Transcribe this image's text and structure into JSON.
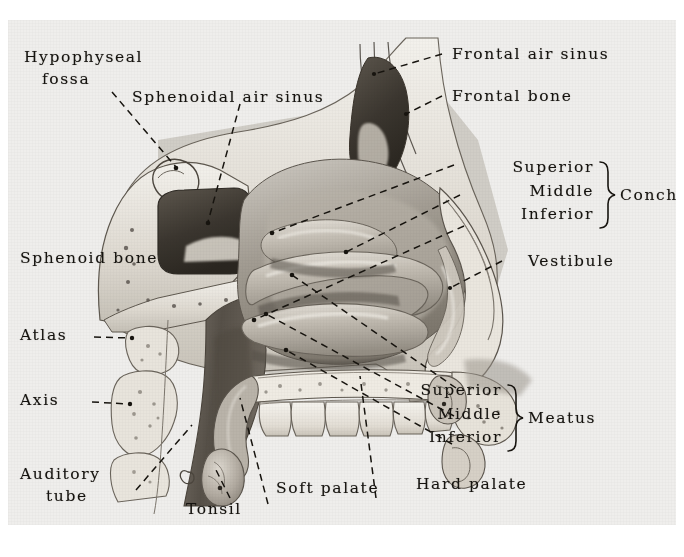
{
  "figure": {
    "medium": "halftone anatomical illustration, grayscale print scan",
    "background_color": "#efeeec",
    "ink_color": "#15130f"
  },
  "labels": {
    "hypophyseal_fossa_line1": "Hypophyseal",
    "hypophyseal_fossa_line2": "fossa",
    "sphenoidal_air_sinus": "Sphenoidal air sinus",
    "sphenoid_bone": "Sphenoid bone",
    "atlas": "Atlas",
    "axis": "Axis",
    "auditory_tube_line1": "Auditory",
    "auditory_tube_line2": "tube",
    "tonsil": "Tonsil",
    "soft_palate": "Soft palate",
    "hard_palate": "Hard palate",
    "frontal_air_sinus": "Frontal air sinus",
    "frontal_bone": "Frontal bone",
    "vestibule": "Vestibule",
    "concha_group": "Concha",
    "meatus_group": "Meatus",
    "concha_items": [
      "Superior",
      "Middle",
      "Inferior"
    ],
    "meatus_items": [
      "Superior",
      "Middle",
      "Inferior"
    ],
    "atlas_dashes": "Atlas--.",
    "axis_dashes": "Axis--."
  },
  "leader_dashes": {
    "style": "dashed",
    "dash_pattern": "7 5",
    "stroke_width": 1.5
  }
}
